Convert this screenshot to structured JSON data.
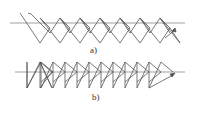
{
  "figure": {
    "panels": [
      {
        "id": "a",
        "label": "a)",
        "description": "Overlapping zigzag stitch pattern crossing a horizontal baseline, with hooked peaks and a terminal arrow",
        "baseline": {
          "x1": 10,
          "x2": 185,
          "y": 23
        },
        "start": [
          20,
          13
        ],
        "peaks": 11,
        "arrow_direction": "up-right"
      },
      {
        "id": "b",
        "label": "b)",
        "description": "Sequence of right-pointing triangles with vertical back edges along a horizontal baseline, ending with a long diagonal and terminal arrow",
        "baseline": {
          "x1": 15,
          "x2": 185,
          "y": 72
        },
        "triangles": 11,
        "arrow_direction": "up-right"
      }
    ],
    "colors": {
      "stroke": "#555555",
      "baseline": "#888888",
      "background": "#ffffff"
    }
  }
}
